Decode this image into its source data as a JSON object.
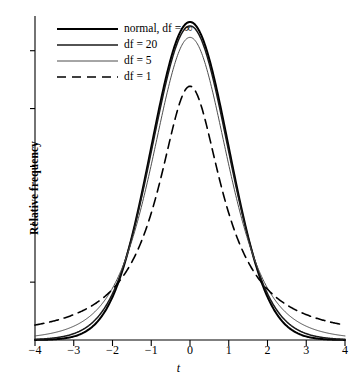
{
  "chart_data": {
    "type": "line",
    "title": "",
    "xlabel": "t",
    "ylabel": "Relative frequency",
    "xlim": [
      -4,
      4
    ],
    "ylim": [
      0,
      0.43
    ],
    "grid": false,
    "legend_position": "top-left",
    "xticks": [
      -4,
      -3,
      -2,
      -1,
      0,
      1,
      2,
      3,
      4
    ],
    "xtick_labels": [
      "−4",
      "−3",
      "−2",
      "−1",
      "0",
      "1",
      "2",
      "3",
      "4"
    ],
    "yticks_count": 5,
    "ytick_labels": [],
    "series": [
      {
        "name": "normal, df = ∞",
        "df": "inf",
        "style": "solid",
        "width": 2.0,
        "color": "#000000",
        "peak": 0.3989,
        "x": [
          -4,
          -3.5,
          -3,
          -2.5,
          -2,
          -1.5,
          -1,
          -0.5,
          0,
          0.5,
          1,
          1.5,
          2,
          2.5,
          3,
          3.5,
          4
        ],
        "y": [
          0.0001,
          0.0009,
          0.0044,
          0.0175,
          0.054,
          0.1295,
          0.242,
          0.3521,
          0.3989,
          0.3521,
          0.242,
          0.1295,
          0.054,
          0.0175,
          0.0044,
          0.0009,
          0.0001
        ]
      },
      {
        "name": "df = 20",
        "df": 20,
        "style": "solid",
        "width": 1.5,
        "color": "#1a1a1a",
        "peak": 0.394,
        "x": [
          -4,
          -3.5,
          -3,
          -2.5,
          -2,
          -1.5,
          -1,
          -0.5,
          0,
          0.5,
          1,
          1.5,
          2,
          2.5,
          3,
          3.5,
          4
        ],
        "y": [
          0.0012,
          0.0031,
          0.0079,
          0.0203,
          0.0508,
          0.1167,
          0.236,
          0.3458,
          0.394,
          0.3458,
          0.236,
          0.1167,
          0.0508,
          0.0203,
          0.0079,
          0.0031,
          0.0012
        ]
      },
      {
        "name": "df = 5",
        "df": 5,
        "style": "solid",
        "width": 1.0,
        "color": "#4d4d4d",
        "peak": 0.3796,
        "x": [
          -4,
          -3.5,
          -3,
          -2.5,
          -2,
          -1.5,
          -1,
          -0.5,
          0,
          0.5,
          1,
          1.5,
          2,
          2.5,
          3,
          3.5,
          4
        ],
        "y": [
          0.0051,
          0.0084,
          0.0173,
          0.0356,
          0.0658,
          0.1245,
          0.2197,
          0.3279,
          0.3796,
          0.3279,
          0.2197,
          0.1245,
          0.0658,
          0.0356,
          0.0173,
          0.0084,
          0.0051
        ]
      },
      {
        "name": "df = 1",
        "df": 1,
        "style": "dashed",
        "width": 1.6,
        "color": "#000000",
        "peak": 0.3183,
        "x": [
          -4,
          -3.5,
          -3,
          -2.5,
          -2,
          -1.5,
          -1,
          -0.5,
          0,
          0.5,
          1,
          1.5,
          2,
          2.5,
          3,
          3.5,
          4
        ],
        "y": [
          0.0187,
          0.0242,
          0.0318,
          0.0439,
          0.0637,
          0.0979,
          0.1592,
          0.2546,
          0.3183,
          0.2546,
          0.1592,
          0.0979,
          0.0637,
          0.0439,
          0.0318,
          0.0242,
          0.0187
        ]
      }
    ]
  },
  "axes": {
    "ylabel": "Relative frequency",
    "xlabel": "t"
  },
  "legend": {
    "entries": [
      {
        "label": "normal, df = ∞"
      },
      {
        "label": "df = 20"
      },
      {
        "label": "df = 5"
      },
      {
        "label": "df = 1"
      }
    ]
  }
}
